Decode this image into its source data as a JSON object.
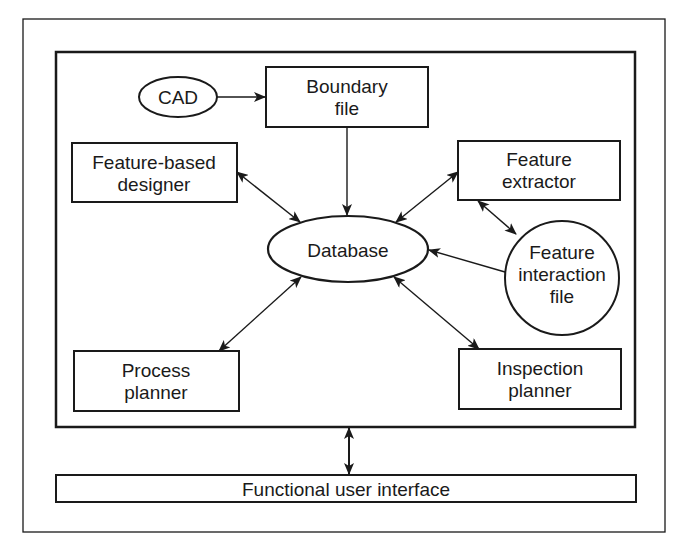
{
  "diagram": {
    "nodes": {
      "cad": {
        "label": [
          "CAD"
        ],
        "shape": "ellipse"
      },
      "boundary_file": {
        "label": [
          "Boundary",
          "file"
        ],
        "shape": "rect"
      },
      "feature_based_designer": {
        "label": [
          "Feature-based",
          "designer"
        ],
        "shape": "rect"
      },
      "feature_extractor": {
        "label": [
          "Feature",
          "extractor"
        ],
        "shape": "rect"
      },
      "database": {
        "label": [
          "Database"
        ],
        "shape": "ellipse"
      },
      "feature_interaction_file": {
        "label": [
          "Feature",
          "interaction",
          "file"
        ],
        "shape": "circle"
      },
      "process_planner": {
        "label": [
          "Process",
          "planner"
        ],
        "shape": "rect"
      },
      "inspection_planner": {
        "label": [
          "Inspection",
          "planner"
        ],
        "shape": "rect"
      },
      "functional_user_interface": {
        "label": [
          "Functional user interface"
        ],
        "shape": "rect"
      }
    },
    "edges": [
      {
        "from": "cad",
        "to": "boundary_file",
        "direction": "forward"
      },
      {
        "from": "boundary_file",
        "to": "database",
        "direction": "forward"
      },
      {
        "from": "feature_based_designer",
        "to": "database",
        "direction": "both"
      },
      {
        "from": "feature_extractor",
        "to": "database",
        "direction": "both"
      },
      {
        "from": "feature_extractor",
        "to": "feature_interaction_file",
        "direction": "both"
      },
      {
        "from": "feature_interaction_file",
        "to": "database",
        "direction": "forward"
      },
      {
        "from": "process_planner",
        "to": "database",
        "direction": "both"
      },
      {
        "from": "inspection_planner",
        "to": "database",
        "direction": "both"
      },
      {
        "from": "system_frame",
        "to": "functional_user_interface",
        "direction": "both"
      }
    ],
    "colors": {
      "stroke": "#1a1a1a",
      "background": "#ffffff"
    }
  }
}
